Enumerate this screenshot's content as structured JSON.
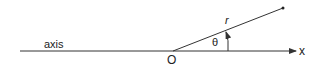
{
  "diagram": {
    "axis_label": "axis",
    "origin_label": "O",
    "x_label": "x",
    "radius_label": "r",
    "angle_label": "θ",
    "line_color": "#333333"
  }
}
